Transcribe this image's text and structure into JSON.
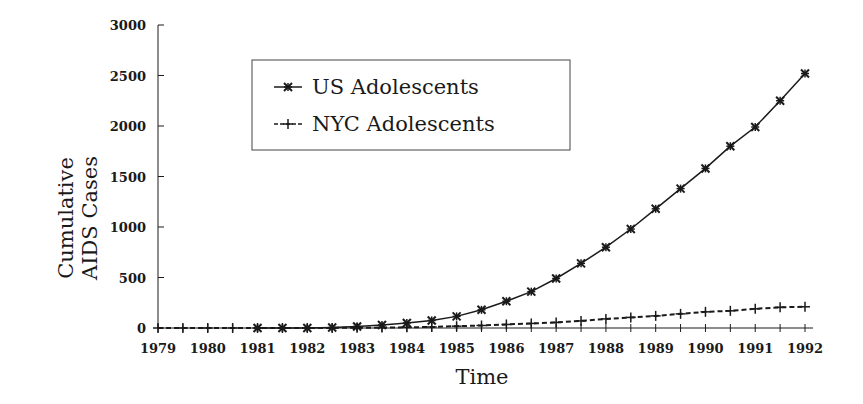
{
  "chart_data": {
    "type": "line",
    "title": "",
    "xlabel": "Time",
    "ylabel": "Cumulative AIDS Cases",
    "ylabel_lines": [
      "Cumulative",
      "AIDS Cases"
    ],
    "xlim": [
      1979,
      1992
    ],
    "ylim": [
      0,
      3000
    ],
    "x_ticks": [
      "1979",
      "1980",
      "1981",
      "1982",
      "1983",
      "1984",
      "1985",
      "1986",
      "1987",
      "1988",
      "1989",
      "1990",
      "1991",
      "1992"
    ],
    "y_ticks": [
      "0",
      "500",
      "1000",
      "1500",
      "2000",
      "2500",
      "3000"
    ],
    "grid": false,
    "legend_position": "upper-left-inside",
    "x": [
      1979.0,
      1979.5,
      1980.0,
      1980.5,
      1981.0,
      1981.5,
      1982.0,
      1982.5,
      1983.0,
      1983.5,
      1984.0,
      1984.5,
      1985.0,
      1985.5,
      1986.0,
      1986.5,
      1987.0,
      1987.5,
      1988.0,
      1988.5,
      1989.0,
      1989.5,
      1990.0,
      1990.5,
      1991.0,
      1991.5,
      1992.0
    ],
    "series": [
      {
        "name": "US Adolescents",
        "marker": "asterisk",
        "line": "solid",
        "start_index": 4,
        "values": [
          null,
          null,
          null,
          null,
          0,
          0,
          0,
          5,
          15,
          30,
          50,
          75,
          115,
          180,
          265,
          360,
          490,
          640,
          800,
          980,
          1180,
          1380,
          1580,
          1800,
          1990,
          2250,
          2520
        ]
      },
      {
        "name": "NYC Adolescents",
        "marker": "plus",
        "line": "dashed",
        "start_index": 0,
        "values": [
          0,
          0,
          0,
          0,
          0,
          0,
          0,
          1,
          2,
          4,
          7,
          10,
          18,
          25,
          35,
          45,
          55,
          70,
          90,
          105,
          120,
          140,
          160,
          170,
          190,
          205,
          210
        ]
      }
    ]
  },
  "legend": {
    "items": [
      {
        "label": "US Adolescents",
        "marker": "asterisk-line-icon"
      },
      {
        "label": "NYC Adolescents",
        "marker": "plus-dashed-line-icon"
      }
    ]
  },
  "colors": {
    "ink": "#1a1a1a",
    "background": "#ffffff"
  }
}
